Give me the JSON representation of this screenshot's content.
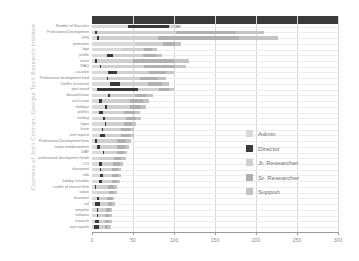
{
  "attribution": "Courtesy of Josh Cothran, Georgia Tech Research Institute",
  "legend": {
    "items": [
      {
        "label": "Admin",
        "color": "#d9d9d9"
      },
      {
        "label": "Director",
        "color": "#3a3a3a"
      },
      {
        "label": "Jr. Researcher",
        "color": "#cfcfcf"
      },
      {
        "label": "Sr. Researcher",
        "color": "#b0b0b0"
      },
      {
        "label": "Support",
        "color": "#c4c4c4"
      }
    ]
  },
  "chart_data": {
    "type": "bar",
    "orientation": "horizontal",
    "stacked": true,
    "title": "",
    "xlabel": "",
    "ylabel": "",
    "xlim": [
      0,
      300
    ],
    "ticks": [
      0,
      50,
      100,
      150,
      200,
      250,
      300
    ],
    "grid": true,
    "legend_position": "right",
    "series": [
      {
        "name": "Admin",
        "color": "#d9d9d9"
      },
      {
        "name": "Director",
        "color": "#3a3a3a"
      },
      {
        "name": "Jr. Researcher",
        "color": "#cfcfcf"
      },
      {
        "name": "Sr. Researcher",
        "color": "#b0b0b0"
      },
      {
        "name": "Support",
        "color": "#c4c4c4"
      }
    ],
    "categories": [
      "Number of Searches",
      "Professional Development",
      "VPN",
      "promotion",
      "logo",
      "profile",
      "travel",
      "IRAQ",
      "vacation",
      "Professional development fund",
      "Conflict of interest",
      "spot award",
      "donated leave",
      "sick Leave",
      "holidays",
      "profiles",
      "holiday",
      "logos",
      "leave",
      "visit request",
      "Professional Development form",
      "tuition reimbursement",
      "DAP",
      "professional development funds",
      "COI",
      "sharepoint",
      "nda",
      "holiday schedule",
      "conflict of interest form",
      "tuition",
      "buzzmart",
      "nsf",
      "template",
      "software",
      "research",
      "spot awards"
    ],
    "values": [
      [
        44,
        50,
        8,
        4,
        2
      ],
      [
        4,
        2,
        96,
        74,
        34
      ],
      [
        6,
        3,
        72,
        98,
        48
      ],
      [
        52,
        1,
        34,
        14,
        8
      ],
      [
        36,
        1,
        26,
        10,
        6
      ],
      [
        18,
        8,
        36,
        16,
        8
      ],
      [
        4,
        2,
        44,
        50,
        18
      ],
      [
        10,
        1,
        52,
        38,
        14
      ],
      [
        20,
        10,
        40,
        20,
        10
      ],
      [
        18,
        2,
        38,
        22,
        10
      ],
      [
        22,
        12,
        34,
        18,
        8
      ],
      [
        6,
        50,
        26,
        12,
        6
      ],
      [
        20,
        2,
        30,
        14,
        8
      ],
      [
        8,
        4,
        34,
        16,
        8
      ],
      [
        16,
        2,
        28,
        14,
        6
      ],
      [
        8,
        5,
        26,
        14,
        6
      ],
      [
        14,
        2,
        26,
        12,
        6
      ],
      [
        16,
        1,
        22,
        10,
        5
      ],
      [
        12,
        2,
        22,
        10,
        5
      ],
      [
        10,
        6,
        20,
        10,
        5
      ],
      [
        4,
        2,
        24,
        12,
        6
      ],
      [
        6,
        4,
        20,
        10,
        5
      ],
      [
        14,
        1,
        16,
        8,
        4
      ],
      [
        8,
        1,
        18,
        9,
        5
      ],
      [
        8,
        4,
        14,
        8,
        4
      ],
      [
        10,
        1,
        14,
        7,
        4
      ],
      [
        10,
        3,
        12,
        7,
        4
      ],
      [
        8,
        4,
        12,
        6,
        4
      ],
      [
        4,
        1,
        14,
        8,
        4
      ],
      [
        8,
        1,
        12,
        6,
        3
      ],
      [
        6,
        2,
        10,
        6,
        3
      ],
      [
        4,
        6,
        10,
        5,
        3
      ],
      [
        6,
        1,
        10,
        5,
        3
      ],
      [
        6,
        1,
        9,
        5,
        3
      ],
      [
        4,
        4,
        8,
        5,
        3
      ],
      [
        2,
        6,
        8,
        4,
        3
      ]
    ]
  }
}
